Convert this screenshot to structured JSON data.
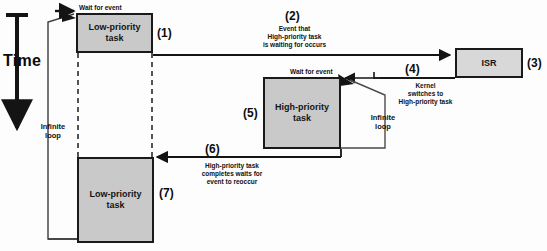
{
  "diagram": {
    "time_axis_label": "Time",
    "colors": {
      "task_fill": "#c9c9c9",
      "isr_fill": "#d8d8d8",
      "stroke": "#1a1a1a",
      "background": "#fdfdfd"
    },
    "boxes": [
      {
        "id": "low-priority-top",
        "label": "Low-priority\ntask",
        "line1": "Low-priority",
        "line2": "task",
        "step": "(1)"
      },
      {
        "id": "isr",
        "label": "ISR",
        "step": "(3)"
      },
      {
        "id": "high-priority",
        "label": "High-priority\ntask",
        "line1": "High-priority",
        "line2": "task",
        "step": "(5)"
      },
      {
        "id": "low-priority-bottom",
        "label": "Low-priority\ntask",
        "line1": "Low-priority",
        "line2": "task",
        "step": "(7)"
      }
    ],
    "annotations": {
      "wait_for_event_top": "Wait for event",
      "wait_for_event_high": "Wait for event",
      "infinite_loop_left": "Infinite\nloop",
      "infinite_loop_left_line1": "Infinite",
      "infinite_loop_left_line2": "loop",
      "infinite_loop_right": "Infinite\nloop",
      "infinite_loop_right_line1": "Infinite",
      "infinite_loop_right_line2": "loop",
      "step2_num": "(2)",
      "step2_line1": "Event that",
      "step2_line2": "High-priority task",
      "step2_line3": "is waiting for occurs",
      "step4_num": "(4)",
      "step4_line1": "Kernel",
      "step4_line2": "switches to",
      "step4_line3": "High-priority task",
      "step6_num": "(6)",
      "step6_line1": "High-priority task",
      "step6_line2": "completes waits for",
      "step6_line3": "event to reoccur"
    },
    "steps": [
      "(1)",
      "(2)",
      "(3)",
      "(4)",
      "(5)",
      "(6)",
      "(7)"
    ]
  }
}
